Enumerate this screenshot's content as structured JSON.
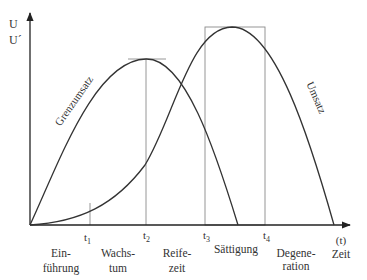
{
  "diagram": {
    "y_axis": {
      "labels": [
        "U",
        "U´"
      ]
    },
    "x_axis": {
      "label_top": "(t)",
      "label_bottom": "Zeit"
    },
    "curves": [
      {
        "name": "Grenzumsatz",
        "label": "Grenzumsatz"
      },
      {
        "name": "Umsatz",
        "label": "Umsatz"
      }
    ],
    "time_marks": [
      {
        "label": "t",
        "sub": "1"
      },
      {
        "label": "t",
        "sub": "2"
      },
      {
        "label": "t",
        "sub": "3"
      },
      {
        "label": "t",
        "sub": "4"
      }
    ],
    "phases": [
      {
        "line1": "Ein-",
        "line2": "führung"
      },
      {
        "line1": "Wachs-",
        "line2": "tum"
      },
      {
        "line1": "Reife-",
        "line2": "zeit"
      },
      {
        "line1": "Sättigung",
        "line2": ""
      },
      {
        "line1": "Degene-",
        "line2": "ration"
      }
    ],
    "colors": {
      "curve": "#333333",
      "guide": "#8a8a8a",
      "axis": "#222222"
    }
  }
}
